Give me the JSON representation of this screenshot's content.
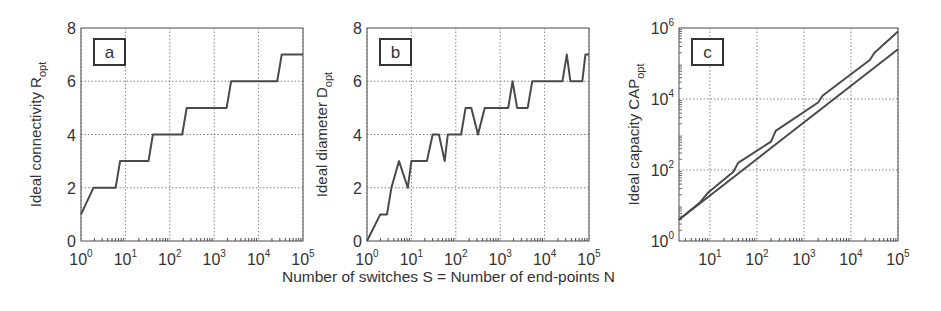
{
  "figure": {
    "xlabel": "Number of switches S = Number of end-points N"
  },
  "chart_data": [
    {
      "panel": "a",
      "type": "line",
      "title": "",
      "ylabel": "Ideal connectivity R",
      "ylabel_sub": "opt",
      "xlabel": "Number of switches S = Number of end-points N",
      "xscale": "log",
      "xlim": [
        1,
        100000
      ],
      "ylim": [
        0,
        8
      ],
      "xticks": [
        "10^0",
        "10^1",
        "10^2",
        "10^3",
        "10^4",
        "10^5"
      ],
      "yticks": [
        0,
        2,
        4,
        6,
        8
      ],
      "grid": true,
      "series": [
        {
          "name": "R_opt",
          "logx": [
            0,
            0.28,
            0.78,
            0.88,
            1.52,
            1.62,
            2.28,
            2.38,
            3.28,
            3.38,
            4.42,
            4.52,
            5.0
          ],
          "y": [
            1,
            2,
            2,
            3,
            3,
            4,
            4,
            5,
            5,
            6,
            6,
            7,
            7
          ]
        }
      ]
    },
    {
      "panel": "b",
      "type": "line",
      "title": "",
      "ylabel": "Ideal diameter D",
      "ylabel_sub": "opt",
      "xlabel": "Number of switches S = Number of end-points N",
      "xscale": "log",
      "xlim": [
        1,
        100000
      ],
      "ylim": [
        0,
        8
      ],
      "xticks": [
        "10^0",
        "10^1",
        "10^2",
        "10^3",
        "10^4",
        "10^5"
      ],
      "yticks": [
        0,
        2,
        4,
        6,
        8
      ],
      "grid": true,
      "series": [
        {
          "name": "D_opt",
          "logx": [
            0,
            0.3,
            0.45,
            0.55,
            0.72,
            0.92,
            1.0,
            1.05,
            1.35,
            1.48,
            1.62,
            1.75,
            1.82,
            2.12,
            2.22,
            2.35,
            2.5,
            2.65,
            3.18,
            3.28,
            3.38,
            3.62,
            3.72,
            4.4,
            4.5,
            4.58,
            4.85,
            4.92,
            5.0
          ],
          "y": [
            0,
            1,
            1,
            2,
            3,
            2,
            3,
            3,
            3,
            4,
            4,
            3,
            4,
            4,
            5,
            5,
            4,
            5,
            5,
            6,
            5,
            5,
            6,
            6,
            7,
            6,
            6,
            7,
            7
          ]
        }
      ]
    },
    {
      "panel": "c",
      "type": "line",
      "title": "",
      "ylabel": "Ideal capacity CAP",
      "ylabel_sub": "opt",
      "xlabel": "Number of switches S = Number of end-points N",
      "xscale": "log",
      "yscale": "log",
      "xlim": [
        2.2,
        100000
      ],
      "ylim": [
        1,
        1000000
      ],
      "xticks": [
        "10^1",
        "10^2",
        "10^3",
        "10^4",
        "10^5"
      ],
      "yticks": [
        "10^0",
        "10^2",
        "10^4",
        "10^6"
      ],
      "grid": true,
      "series": [
        {
          "name": "CAP_opt (upper)",
          "logx": [
            0.34,
            0.8,
            0.95,
            1.5,
            1.6,
            2.3,
            2.4,
            3.3,
            3.4,
            4.4,
            4.5,
            5.0
          ],
          "logy": [
            0.6,
            1.1,
            1.35,
            1.95,
            2.2,
            2.8,
            3.1,
            3.9,
            4.1,
            5.1,
            5.3,
            5.9
          ]
        },
        {
          "name": "lower bound",
          "logx": [
            0.34,
            5.0
          ],
          "logy": [
            0.6,
            5.4
          ]
        }
      ]
    }
  ]
}
